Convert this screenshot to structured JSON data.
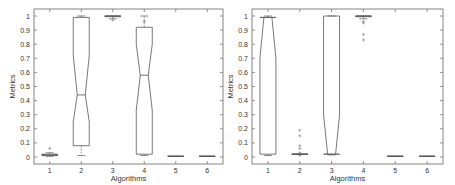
{
  "chart_data": [
    {
      "type": "box",
      "title": "",
      "xlabel": "Algorithms",
      "ylabel": "Metrics",
      "ylim": [
        -0.05,
        1.05
      ],
      "yticks": [
        "0",
        "0.1",
        "0.2",
        "0.3",
        "0.4",
        "0.5",
        "0.6",
        "0.7",
        "0.8",
        "0.9",
        "1"
      ],
      "categories": [
        "1",
        "2",
        "3",
        "4",
        "5",
        "6"
      ],
      "boxes": [
        {
          "q1": 0.01,
          "median": 0.015,
          "q3": 0.02,
          "wlo": 0.005,
          "whi": 0.03,
          "notch_lo": 0.012,
          "notch_hi": 0.018,
          "outliers": [
            0.06
          ]
        },
        {
          "q1": 0.08,
          "median": 0.44,
          "q3": 0.99,
          "wlo": 0.01,
          "whi": 1.0,
          "notch_lo": 0.25,
          "notch_hi": 0.72,
          "outliers": []
        },
        {
          "q1": 0.995,
          "median": 1.0,
          "q3": 1.0,
          "wlo": 0.98,
          "whi": 1.0,
          "notch_lo": 0.998,
          "notch_hi": 1.0,
          "outliers": [
            0.97
          ]
        },
        {
          "q1": 0.02,
          "median": 0.58,
          "q3": 0.92,
          "wlo": 0.01,
          "whi": 1.0,
          "notch_lo": 0.33,
          "notch_hi": 0.8,
          "outliers": [
            0.96
          ]
        },
        {
          "q1": 0.005,
          "median": 0.005,
          "q3": 0.005,
          "wlo": 0.005,
          "whi": 0.005,
          "notch_lo": 0.005,
          "notch_hi": 0.005,
          "outliers": []
        },
        {
          "q1": 0.005,
          "median": 0.005,
          "q3": 0.005,
          "wlo": 0.005,
          "whi": 0.005,
          "notch_lo": 0.005,
          "notch_hi": 0.005,
          "outliers": []
        }
      ]
    },
    {
      "type": "box",
      "title": "",
      "xlabel": "Algorithms",
      "ylabel": "Metrics",
      "ylim": [
        -0.05,
        1.05
      ],
      "yticks": [
        "0",
        "0.1",
        "0.2",
        "0.3",
        "0.4",
        "0.5",
        "0.6",
        "0.7",
        "0.8",
        "0.9",
        "1"
      ],
      "categories": [
        "1",
        "2",
        "3",
        "4",
        "5",
        "6"
      ],
      "boxes": [
        {
          "q1": 0.02,
          "median": 0.99,
          "q3": 0.99,
          "wlo": 0.01,
          "whi": 1.0,
          "notch_lo": 0.7,
          "notch_hi": 0.99,
          "outliers": []
        },
        {
          "q1": 0.02,
          "median": 0.02,
          "q3": 0.02,
          "wlo": 0.02,
          "whi": 0.02,
          "notch_lo": 0.02,
          "notch_hi": 0.02,
          "outliers": [
            0.19,
            0.15,
            0.08,
            0.06,
            0.03,
            0.01
          ]
        },
        {
          "q1": 0.02,
          "median": 0.02,
          "q3": 1.0,
          "wlo": 0.015,
          "whi": 1.0,
          "notch_lo": 0.02,
          "notch_hi": 0.3,
          "outliers": []
        },
        {
          "q1": 0.995,
          "median": 1.0,
          "q3": 1.0,
          "wlo": 0.98,
          "whi": 1.0,
          "notch_lo": 0.998,
          "notch_hi": 1.0,
          "outliers": [
            0.96,
            0.95,
            0.87,
            0.83
          ]
        },
        {
          "q1": 0.005,
          "median": 0.005,
          "q3": 0.005,
          "wlo": 0.005,
          "whi": 0.005,
          "notch_lo": 0.005,
          "notch_hi": 0.005,
          "outliers": []
        },
        {
          "q1": 0.005,
          "median": 0.005,
          "q3": 0.005,
          "wlo": 0.005,
          "whi": 0.005,
          "notch_lo": 0.005,
          "notch_hi": 0.005,
          "outliers": []
        }
      ]
    }
  ]
}
